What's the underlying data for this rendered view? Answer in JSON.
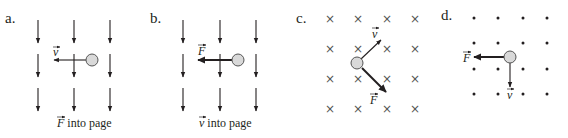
{
  "panels": [
    {
      "label": "a.",
      "field": "downward-arrows",
      "particle_vector": "v",
      "caption_vector": "F",
      "caption_text": "into page"
    },
    {
      "label": "b.",
      "field": "downward-arrows",
      "particle_vector": "F",
      "caption_vector": "v",
      "caption_text": "into page"
    },
    {
      "label": "c.",
      "field": "into-page-crosses",
      "vectors": [
        "v",
        "F"
      ]
    },
    {
      "label": "d.",
      "field": "out-of-page-dots",
      "vectors": [
        "F",
        "v"
      ]
    }
  ],
  "symbols": {
    "cross": "×"
  },
  "colors": {
    "ink": "#231f20",
    "particle_fill": "#d9d9d9",
    "particle_stroke": "#555555"
  }
}
